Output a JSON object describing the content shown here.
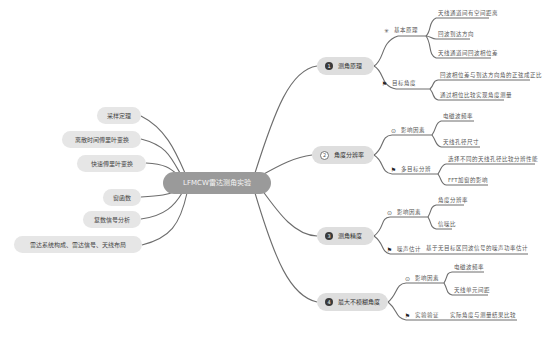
{
  "root": {
    "label": "LFMCW雷达测角实验"
  },
  "left_topics": [
    {
      "label": "采样定理"
    },
    {
      "label": "离散时间傅里叶变换"
    },
    {
      "label": "快速傅里叶变换"
    },
    {
      "label": "窗函数"
    },
    {
      "label": "复数信号分析"
    },
    {
      "label": "雷达系统构成、雷达信号、天线布局"
    }
  ],
  "right_topics": [
    {
      "number": "1",
      "label": "测角原理",
      "subtopics": [
        {
          "icon": "asterisk-icon",
          "label": "基本原理",
          "leaves": [
            "天线通道间有空间距离",
            "回波到达方向",
            "天线通道间回波相位差"
          ]
        },
        {
          "icon": "flag-icon",
          "label": "目标角度",
          "leaves": [
            "回波相位差与到达方向角的正弦成正比",
            "通过相位比较实现角度测量"
          ]
        }
      ]
    },
    {
      "number": "2",
      "label": "角度分辨率",
      "subtopics": [
        {
          "icon": "info-circle-icon",
          "label": "影响因素",
          "leaves": [
            "电磁波频率",
            "天线孔径尺寸"
          ]
        },
        {
          "icon": "flag-icon",
          "label": "多目标分辨",
          "leaves": [
            "选择不同的天线孔径比较分辨性能",
            "FFT加窗的影响"
          ]
        }
      ]
    },
    {
      "number": "3",
      "label": "测角精度",
      "subtopics": [
        {
          "icon": "info-circle-icon",
          "label": "影响因素",
          "leaves": [
            "角度分辨率",
            "信噪比"
          ]
        },
        {
          "icon": "flag-icon",
          "label": "噪声估计",
          "leaves": [
            "基于无目标区回波信号的噪声功率估计"
          ]
        }
      ]
    },
    {
      "number": "4",
      "label": "最大不模糊角度",
      "subtopics": [
        {
          "icon": "info-circle-icon",
          "label": "影响因素",
          "leaves": [
            "电磁波频率",
            "天线单元间距"
          ]
        },
        {
          "icon": "flag-icon",
          "label": "实验验证",
          "leaves": [
            "实际角度与测量结果比较"
          ]
        }
      ]
    }
  ],
  "colors": {
    "root_fill": "#9a9a9a",
    "topic_fill": "#dedede",
    "connector": "#6d6d6d"
  }
}
